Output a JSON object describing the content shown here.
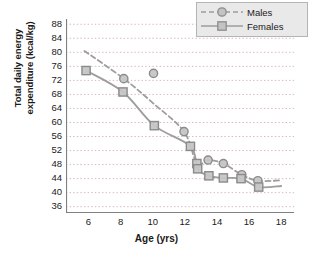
{
  "chart_data": {
    "type": "scatter",
    "title": "",
    "xlabel": "Age (yrs)",
    "ylabel_line1": "Total daily energy",
    "ylabel_line2": "expenditure (kcal/kg)",
    "xlim": [
      4.6,
      18.8
    ],
    "ylim": [
      34.2,
      89.5
    ],
    "xticks": [
      6,
      8,
      10,
      12,
      14,
      16,
      18
    ],
    "yticks": [
      36,
      40,
      44,
      48,
      52,
      56,
      60,
      64,
      68,
      72,
      76,
      80,
      84,
      88
    ],
    "grid": "horizontal-dotted",
    "legend_position": "top-right",
    "accent_color": "#9a9a9a",
    "grid_color": "#d8b8b8",
    "axis_color": "#808080",
    "series": [
      {
        "name": "Males",
        "marker": "circle",
        "line": "dashed",
        "color": "#9d9d9d",
        "points": [
          {
            "x": 8.2,
            "y": 72.5
          },
          {
            "x": 10.05,
            "y": 74.0
          },
          {
            "x": 11.95,
            "y": 57.4
          },
          {
            "x": 13.45,
            "y": 49.3
          },
          {
            "x": 14.4,
            "y": 48.3
          },
          {
            "x": 15.55,
            "y": 45.1
          },
          {
            "x": 16.55,
            "y": 43.4
          }
        ],
        "curve": [
          {
            "x": 5.75,
            "y": 80.4
          },
          {
            "x": 8.2,
            "y": 72.5
          },
          {
            "x": 10.0,
            "y": 65.6
          },
          {
            "x": 11.95,
            "y": 57.4
          },
          {
            "x": 12.75,
            "y": 48.4
          },
          {
            "x": 13.45,
            "y": 49.3
          },
          {
            "x": 14.4,
            "y": 48.3
          },
          {
            "x": 15.55,
            "y": 45.1
          },
          {
            "x": 16.55,
            "y": 43.4
          },
          {
            "x": 18.0,
            "y": 43.5
          }
        ]
      },
      {
        "name": "Females",
        "marker": "square",
        "line": "solid",
        "color": "#9d9d9d",
        "points": [
          {
            "x": 5.85,
            "y": 74.8
          },
          {
            "x": 8.15,
            "y": 68.7
          },
          {
            "x": 10.1,
            "y": 59.1
          },
          {
            "x": 12.35,
            "y": 53.2
          },
          {
            "x": 12.75,
            "y": 48.3
          },
          {
            "x": 12.8,
            "y": 46.8
          },
          {
            "x": 13.5,
            "y": 44.8
          },
          {
            "x": 14.4,
            "y": 44.2
          },
          {
            "x": 15.5,
            "y": 44.0
          },
          {
            "x": 16.6,
            "y": 41.6
          }
        ],
        "curve": [
          {
            "x": 5.85,
            "y": 74.8
          },
          {
            "x": 8.15,
            "y": 68.7
          },
          {
            "x": 10.1,
            "y": 59.1
          },
          {
            "x": 12.35,
            "y": 53.2
          },
          {
            "x": 12.8,
            "y": 46.8
          },
          {
            "x": 13.5,
            "y": 44.8
          },
          {
            "x": 14.4,
            "y": 44.2
          },
          {
            "x": 15.5,
            "y": 44.0
          },
          {
            "x": 16.6,
            "y": 41.6
          },
          {
            "x": 18.0,
            "y": 41.9
          }
        ]
      }
    ]
  },
  "legend": {
    "items": [
      {
        "label": "Males"
      },
      {
        "label": "Females"
      }
    ]
  }
}
